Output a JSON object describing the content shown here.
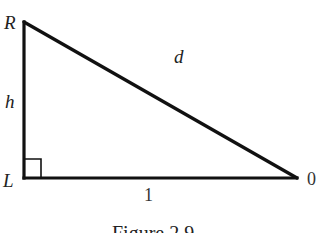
{
  "figure": {
    "caption": "Figure 2.9",
    "stroke_color": "#111111",
    "vertices": {
      "R": {
        "label": "R",
        "x": 24,
        "y": 22
      },
      "L": {
        "label": "L",
        "x": 24,
        "y": 178
      },
      "O": {
        "label": "0",
        "x": 297,
        "y": 178
      }
    },
    "sides": {
      "vertical": {
        "label": "h"
      },
      "hypotenuse": {
        "label": "d"
      },
      "base": {
        "label": "1"
      }
    },
    "right_angle_marker": {
      "at": "L",
      "size": 17
    }
  }
}
